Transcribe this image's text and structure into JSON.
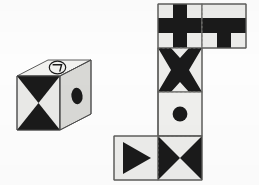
{
  "figure": {
    "kind": "spatial-reasoning-puzzle",
    "background_color": "#fdfdfd",
    "ink_color": "#1a1a1a",
    "face_fill": "#e9e9e7",
    "face_shade_top": "#f2f2f0",
    "face_shade_right": "#d7d7d4",
    "outline_color": "#4a4a4a",
    "fold_line_color": "#8d8d8a"
  },
  "cube": {
    "label": "cube",
    "faces": [
      {
        "name": "top-face",
        "pattern": "circled-glyph",
        "glyph": "ᄀ",
        "glyph_label": "circled-giyeok-symbol"
      },
      {
        "name": "front-face",
        "pattern": "hourglass",
        "pattern_label": "vertical-bowtie-two-triangles"
      },
      {
        "name": "right-face",
        "pattern": "ellipse-dot",
        "pattern_label": "solid-oval-dot"
      }
    ]
  },
  "net": {
    "label": "unfolded-net",
    "squares": [
      {
        "name": "net-square-plus",
        "pattern": "plus",
        "row": 0,
        "col": 0
      },
      {
        "name": "net-square-tee",
        "pattern": "tee",
        "row": 0,
        "col": 1
      },
      {
        "name": "net-square-x",
        "pattern": "x-cross",
        "row": 1,
        "col": 0
      },
      {
        "name": "net-square-dot",
        "pattern": "dot",
        "row": 2,
        "col": 0
      },
      {
        "name": "net-square-triangle",
        "pattern": "right-triangle",
        "row": 3,
        "col": -1
      },
      {
        "name": "net-square-bowtie",
        "pattern": "bowtie",
        "row": 3,
        "col": 0
      }
    ]
  }
}
